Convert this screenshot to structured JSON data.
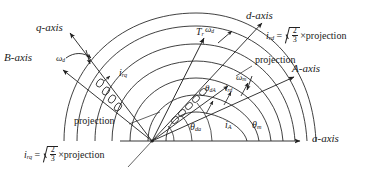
{
  "figure": {
    "type": "vector-diagram"
  },
  "axes": [
    {
      "id": "q-axis",
      "label": "q-axis"
    },
    {
      "id": "B-axis",
      "label": "B-axis"
    },
    {
      "id": "d-axis",
      "label": "d-axis"
    },
    {
      "id": "A-axis",
      "label": "A-axis"
    },
    {
      "id": "a-axis",
      "label": "a-axis"
    }
  ],
  "vectors": {
    "torque": {
      "symbol": "T",
      "subscript": "r"
    },
    "current_rq": {
      "symbol": "i",
      "subscript": "rq"
    },
    "current_rd": {
      "symbol": "i",
      "subscript": "rd"
    },
    "current_A": {
      "symbol": "i",
      "subscript": "A"
    }
  },
  "speeds": {
    "omega_d": {
      "symbol": "ω",
      "subscript": "d"
    },
    "omega_m": {
      "symbol": "ω",
      "subscript": "m"
    }
  },
  "angles": {
    "theta_dA": {
      "symbol": "θ",
      "subscript": "dA"
    },
    "theta_da": {
      "symbol": "θ",
      "subscript": "da"
    },
    "theta_m": {
      "symbol": "θ",
      "subscript": "m"
    }
  },
  "equations": [
    {
      "id": "eq-ird",
      "lhs_symbol": "i",
      "lhs_sub": "rd",
      "equals": "=",
      "numerator": "2",
      "denominator": "3",
      "times": "×",
      "operand": "projection"
    },
    {
      "id": "eq-irq",
      "lhs_symbol": "i",
      "lhs_sub": "rq",
      "equals": "=",
      "numerator": "2",
      "denominator": "3",
      "times": "×",
      "operand": "projection"
    }
  ],
  "callouts": [
    {
      "id": "projection-top",
      "label": "projection"
    },
    {
      "id": "projection-left",
      "label": "projection"
    }
  ],
  "colors": {
    "stroke": "#1f1f1f",
    "background": "#ffffff",
    "text": "#1a1a1a"
  }
}
